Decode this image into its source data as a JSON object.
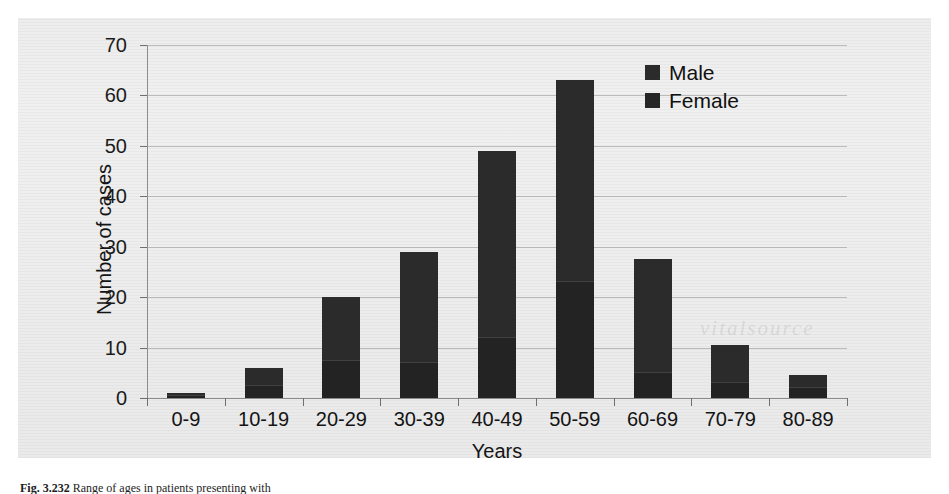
{
  "figure": {
    "watermark_text": "vitalsource",
    "caption_label": "Fig. 3.232",
    "caption_text": "Range of ages in patients presenting with"
  },
  "chart_data": {
    "type": "bar",
    "stacked": true,
    "title": "",
    "subtitle": "",
    "xlabel": "Years",
    "ylabel": "Number of cases",
    "categories": [
      "0-9",
      "10-19",
      "20-29",
      "30-39",
      "40-49",
      "50-59",
      "60-69",
      "70-79",
      "80-89"
    ],
    "series": [
      {
        "name": "Female",
        "color": "#232323",
        "values": [
          0.5,
          2.5,
          7.5,
          7,
          12,
          23,
          5,
          3,
          2
        ]
      },
      {
        "name": "Male",
        "color": "#2b2b2b",
        "values": [
          0.5,
          3.5,
          12.5,
          22,
          37,
          40,
          22.5,
          7.5,
          2.5
        ]
      }
    ],
    "totals": [
      1,
      6,
      20,
      29,
      49,
      63,
      27.5,
      10.5,
      4.5
    ],
    "ylim": [
      0,
      70
    ],
    "ytick_values": [
      0,
      10,
      20,
      30,
      40,
      50,
      60,
      70
    ],
    "ytick_labels": [
      "0",
      "10",
      "20",
      "30",
      "40",
      "50",
      "60",
      "70"
    ],
    "grid": true,
    "legend_position": "top-right",
    "legend_entries": [
      "Male",
      "Female"
    ]
  }
}
